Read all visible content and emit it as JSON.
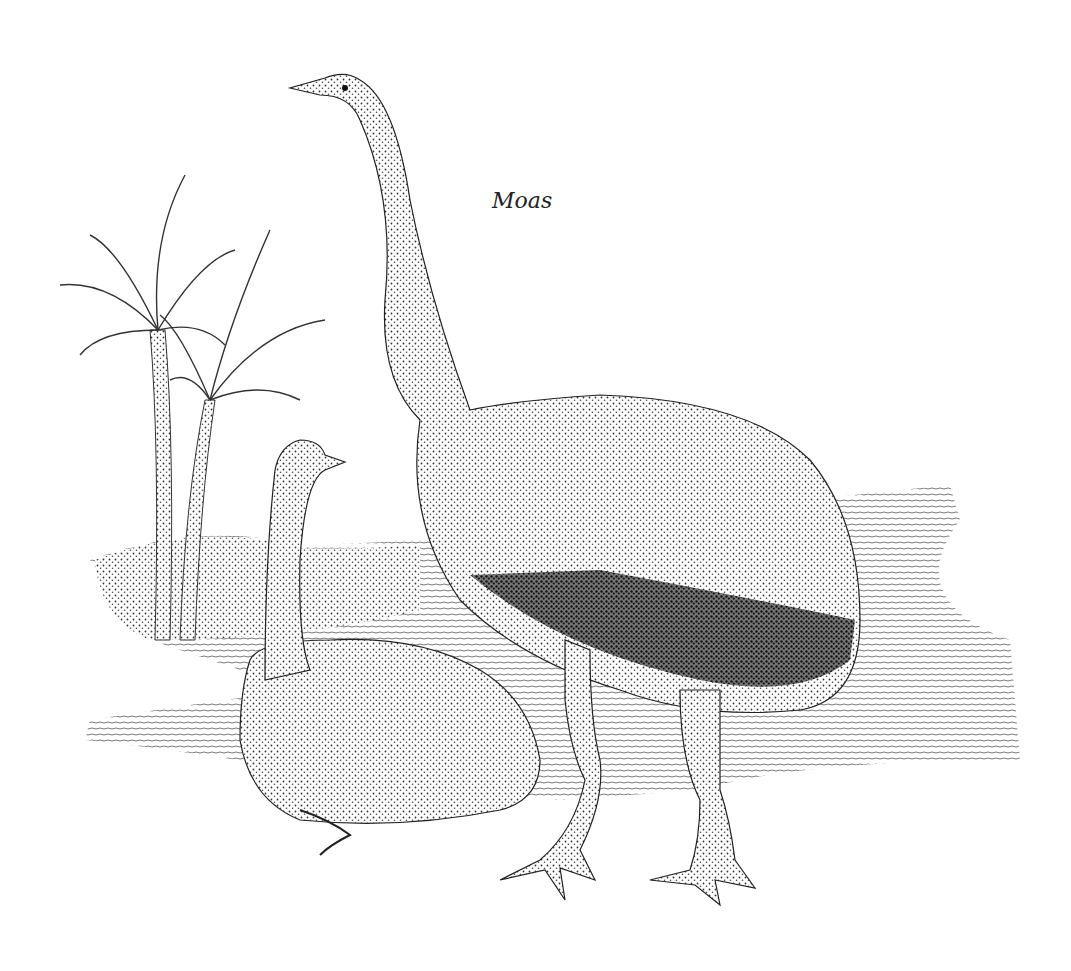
{
  "illustration": {
    "caption": "Moas",
    "subjects": [
      "standing moa",
      "sitting moa",
      "palm trees"
    ],
    "style": "stippled pen-and-ink",
    "ink_color": "#1a1a1a",
    "background_color": "#ffffff"
  }
}
